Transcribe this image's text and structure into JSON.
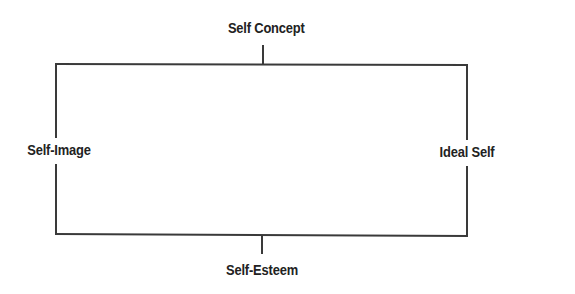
{
  "diagram": {
    "type": "concept-frame",
    "nodes": {
      "top": {
        "label": "Self Concept"
      },
      "left": {
        "label": "Self-Image"
      },
      "right": {
        "label": "Ideal Self"
      },
      "bottom": {
        "label": "Self-Esteem"
      }
    },
    "edges": [
      {
        "from": "Self Concept",
        "to": "frame-top"
      },
      {
        "from": "Self-Image",
        "to": "frame-left"
      },
      {
        "from": "Ideal Self",
        "to": "frame-right"
      },
      {
        "from": "Self-Esteem",
        "to": "frame-bottom"
      }
    ],
    "line_color": "#3a3a3a",
    "text_color": "#222222"
  }
}
